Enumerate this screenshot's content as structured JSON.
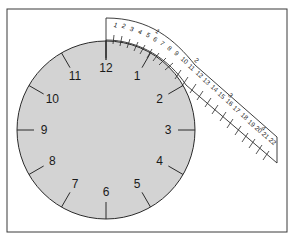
{
  "figure": {
    "colors": {
      "clock_fill": "#d3d3d3",
      "stroke": "#2a2a2a",
      "frame": "#3a3a3a",
      "tape_fill": "#ffffff"
    }
  },
  "clock": {
    "hours": [
      "12",
      "1",
      "2",
      "3",
      "4",
      "5",
      "6",
      "7",
      "8",
      "9",
      "10",
      "11"
    ]
  },
  "tape": {
    "minor_marks": [
      "1",
      "2",
      "3",
      "4",
      "5",
      "6",
      "7",
      "8",
      "9",
      "10",
      "11",
      "12",
      "13",
      "14",
      "15",
      "16",
      "17",
      "18",
      "19",
      "20",
      "21",
      "22"
    ],
    "major_marks": [
      "1",
      "2",
      "3",
      "4"
    ]
  }
}
